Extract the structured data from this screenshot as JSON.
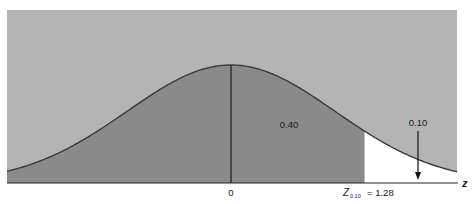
{
  "chart_data": {
    "type": "area",
    "title": "",
    "xlabel": "z",
    "ylabel": "",
    "xlim": [
      -2.15,
      2.17
    ],
    "x_ticks": [
      {
        "value": 0,
        "label": "0"
      },
      {
        "value": 1.28,
        "label": "Z0.10 = 1.28"
      }
    ],
    "regions": [
      {
        "name": "left of mean",
        "from": -2.15,
        "to": 0,
        "area": 0.5,
        "shade": "dark"
      },
      {
        "name": "between mean and z",
        "from": 0,
        "to": 1.28,
        "area": 0.4,
        "label": "0.40",
        "shade": "dark"
      },
      {
        "name": "upper tail",
        "from": 1.28,
        "to": 2.17,
        "area": 0.1,
        "label": "0.10",
        "shade": "white"
      }
    ],
    "annotations": [
      {
        "text": "0.40",
        "position": "between 0 and 1.28"
      },
      {
        "text": "0.10",
        "position": "upper tail",
        "arrow": "down to tail"
      }
    ],
    "grid": false,
    "legend": null
  },
  "labels": {
    "area_middle": "0.40",
    "area_tail": "0.10",
    "tick_zero": "0",
    "z_symbol": "Z",
    "z_subscript": "0.10",
    "z_equals": "= 1.28",
    "axis_label": "z"
  },
  "colors": {
    "background_panel": "#b4b4b4",
    "shaded_area": "#8a8a8a",
    "tail_area": "#ffffff",
    "curve": "#3a3a3a",
    "axis": "#222222"
  }
}
